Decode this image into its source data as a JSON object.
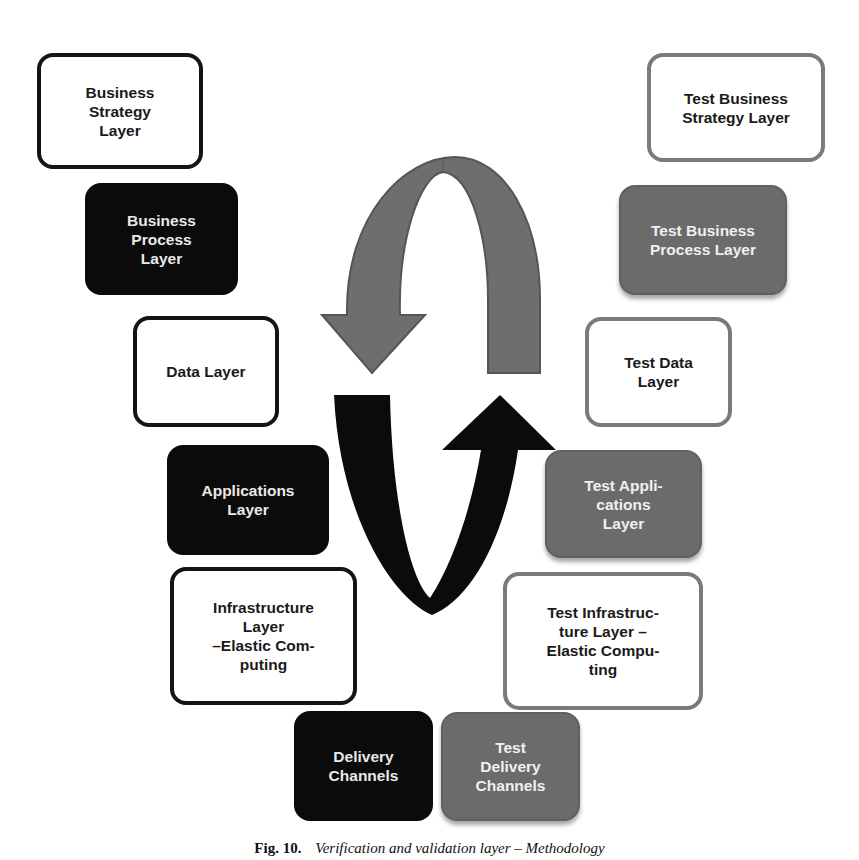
{
  "diagram": {
    "type": "cycle-layers",
    "left_column_label_style": "business layers (black)",
    "right_column_label_style": "test layers (gray)",
    "colors": {
      "dark": "#0b0b0b",
      "gray": "#6b6b6b",
      "gray_border": "#7a7a7a",
      "white": "#ffffff"
    },
    "left_boxes": [
      {
        "id": "business-strategy",
        "label": "Business\nStrategy\nLayer",
        "style": "outline-dark"
      },
      {
        "id": "business-process",
        "label": "Business\nProcess\nLayer",
        "style": "fill-dark"
      },
      {
        "id": "data",
        "label": "Data Layer",
        "style": "outline-dark"
      },
      {
        "id": "applications",
        "label": "Applications\nLayer",
        "style": "fill-dark"
      },
      {
        "id": "infrastructure",
        "label": "Infrastructure\nLayer\n–Elastic Com-\nputing",
        "style": "outline-dark"
      },
      {
        "id": "delivery",
        "label": "Delivery\nChannels",
        "style": "fill-dark"
      }
    ],
    "right_boxes": [
      {
        "id": "test-business-strategy",
        "label": "Test Business\nStrategy Layer",
        "style": "outline-gray"
      },
      {
        "id": "test-business-process",
        "label": "Test Business\nProcess Layer",
        "style": "fill-gray"
      },
      {
        "id": "test-data",
        "label": "Test Data\nLayer",
        "style": "outline-gray"
      },
      {
        "id": "test-applications",
        "label": "Test Appli-\ncations\nLayer",
        "style": "fill-gray"
      },
      {
        "id": "test-infrastructure",
        "label": "Test Infrastruc-\nture Layer –\nElastic Compu-\nting",
        "style": "outline-gray"
      },
      {
        "id": "test-delivery",
        "label": "Test\nDelivery\nChannels",
        "style": "fill-gray"
      }
    ],
    "arrows": [
      {
        "name": "gray-arch-arrow",
        "color": "#6e6e6e",
        "direction": "from right side up and over, pointing down on left"
      },
      {
        "name": "black-u-arrow",
        "color": "#0b0b0b",
        "direction": "from left side down and around, pointing up on right"
      }
    ]
  },
  "caption": {
    "number": "Fig. 10.",
    "text": "Verification and validation layer – Methodology"
  }
}
